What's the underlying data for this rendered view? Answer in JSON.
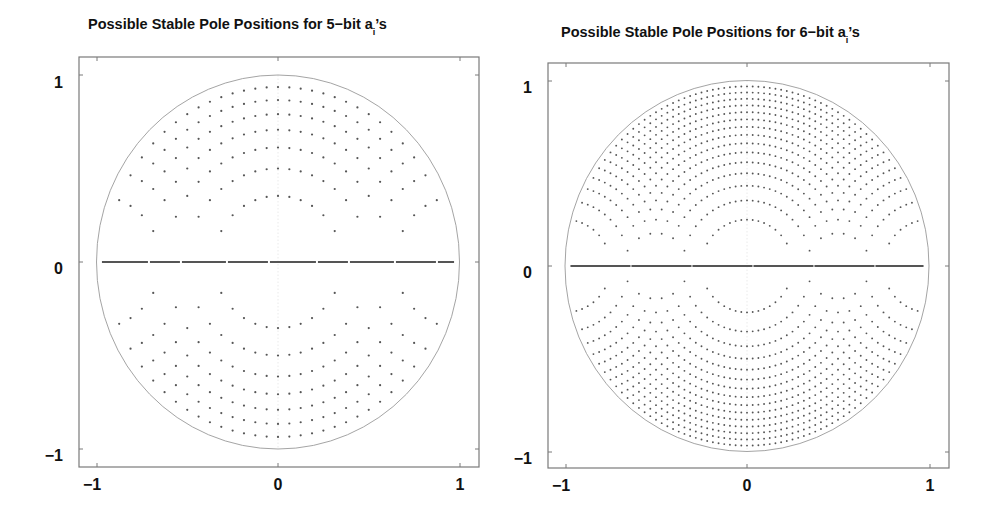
{
  "chart_data": [
    {
      "type": "scatter",
      "title": "Possible Stable Pole Positions for 5-bit a_i's",
      "title_main": "Possible Stable Pole Positions for 5−bit a",
      "title_sub": "i",
      "title_tail": "’s",
      "bits": 5,
      "xlabel": "",
      "ylabel": "",
      "xlim": [
        -1.1,
        1.1
      ],
      "ylim": [
        -1.1,
        1.1
      ],
      "xticks": [
        -1,
        0,
        1
      ],
      "xtick_labels": [
        "−1",
        "0",
        "1"
      ],
      "yticks": [
        -1,
        0,
        1
      ],
      "ytick_labels": [
        "−1",
        "0",
        "1"
      ],
      "grid": false,
      "legend": null,
      "annotations": [
        "unit circle"
      ],
      "description": "Stable pole positions of z^2 + a1 z + a2 with 5-bit quantized coefficients; dots inside unit circle plus dense real-axis poles"
    },
    {
      "type": "scatter",
      "title": "Possible Stable Pole Positions for 6-bit a_i's",
      "title_main": "Possible Stable Pole Positions for 6−bit a",
      "title_sub": "i",
      "title_tail": "’s",
      "bits": 6,
      "xlabel": "",
      "ylabel": "",
      "xlim": [
        -1.1,
        1.1
      ],
      "ylim": [
        -1.1,
        1.1
      ],
      "xticks": [
        -1,
        0,
        1
      ],
      "xtick_labels": [
        "−1",
        "0",
        "1"
      ],
      "yticks": [
        -1,
        0,
        1
      ],
      "ytick_labels": [
        "−1",
        "0",
        "1"
      ],
      "grid": false,
      "legend": null,
      "annotations": [
        "unit circle"
      ],
      "description": "Stable pole positions of z^2 + a1 z + a2 with 6-bit quantized coefficients; denser dots inside unit circle plus real-axis poles"
    }
  ],
  "colors": {
    "axes": "#7a7a7a",
    "circle": "#9a9a9a",
    "dots": "#555555",
    "text": "#111111"
  }
}
